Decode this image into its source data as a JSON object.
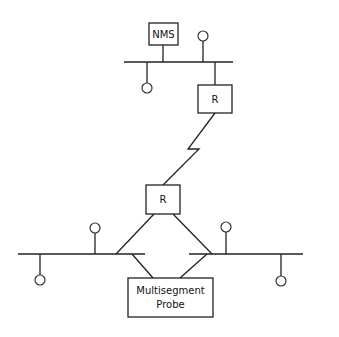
{
  "diagram": {
    "type": "network-topology",
    "nodes": {
      "nms": {
        "label": "NMS"
      },
      "router_top": {
        "label": "R"
      },
      "router_bottom": {
        "label": "R"
      },
      "probe": {
        "line1": "Multisegment",
        "line2": "Probe"
      }
    },
    "segments": [
      {
        "name": "top-lan",
        "hosts": 2,
        "attached": [
          "NMS",
          "R"
        ]
      },
      {
        "name": "bottom-left-lan",
        "hosts": 2,
        "attached": [
          "R",
          "Multisegment Probe"
        ]
      },
      {
        "name": "bottom-right-lan",
        "hosts": 2,
        "attached": [
          "R",
          "Multisegment Probe"
        ]
      }
    ],
    "links": [
      {
        "from": "router_top",
        "to": "router_bottom",
        "style": "wan-zigzag"
      }
    ],
    "colors": {
      "stroke": "#222222",
      "background": "#ffffff"
    }
  }
}
